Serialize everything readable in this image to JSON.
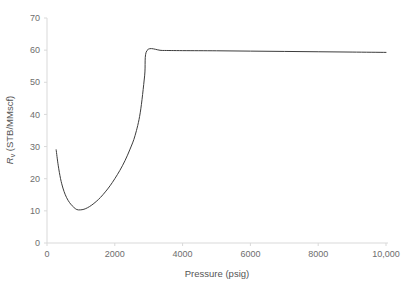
{
  "chart_data": {
    "type": "line",
    "title": "",
    "xlabel": "Pressure (psig)",
    "ylabel": "Rv (STB/MMscf)",
    "ylabel_parts": {
      "symbol": "R",
      "subscript": "v",
      "units": "(STB/MMscf)"
    },
    "xlim": [
      0,
      10000
    ],
    "ylim": [
      0,
      70
    ],
    "xticks": [
      0,
      2000,
      4000,
      6000,
      8000,
      10000
    ],
    "xtick_labels": [
      "0",
      "2000",
      "4000",
      "6000",
      "8000",
      "10,000"
    ],
    "yticks": [
      0,
      10,
      20,
      30,
      40,
      50,
      60,
      70
    ],
    "ytick_labels": [
      "0",
      "10",
      "20",
      "30",
      "40",
      "50",
      "60",
      "70"
    ],
    "grid": false,
    "legend": false,
    "series": [
      {
        "name": "Rv",
        "color": "#3c3c3c",
        "x": [
          270,
          330,
          400,
          470,
          540,
          620,
          700,
          790,
          880,
          980,
          1090,
          1200,
          1320,
          1450,
          1580,
          1720,
          1860,
          2000,
          2150,
          2300,
          2450,
          2600,
          2750,
          2880,
          2950,
          3400,
          4000,
          5000,
          6000,
          7000,
          8000,
          9000,
          10000
        ],
        "y": [
          29.0,
          24.2,
          20.0,
          17.1,
          15.0,
          13.3,
          12.1,
          11.1,
          10.4,
          10.3,
          10.5,
          11.0,
          11.8,
          12.9,
          14.2,
          15.9,
          17.8,
          20.0,
          22.6,
          25.6,
          29.2,
          33.5,
          40.5,
          52.0,
          59.9,
          59.9,
          59.85,
          59.8,
          59.7,
          59.6,
          59.5,
          59.4,
          59.3
        ]
      }
    ],
    "annotations": {
      "minimum": {
        "x": 880,
        "y": 10.4
      },
      "plateau_knee": {
        "x": 2950,
        "y": 59.9
      },
      "plateau_value": 59.9
    }
  },
  "axis": {
    "x_title": "Pressure (psig)",
    "y_symbol": "R",
    "y_subscript": "v",
    "y_units": "(STB/MMscf)"
  }
}
